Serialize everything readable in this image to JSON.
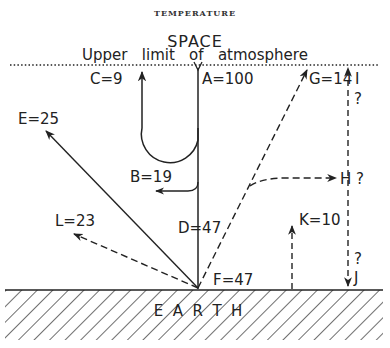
{
  "header": {
    "title": "TEMPERATURE"
  },
  "diagram": {
    "space_label": "SPACE",
    "upper_limit_label": "Upper   limit   of   atmosphere",
    "earth_label": "E  A  R  T  H",
    "labels": {
      "A": "A=100",
      "B": "B=19",
      "C": "C=9",
      "D": "D=47",
      "E": "E=25",
      "F": "F=47",
      "G": "G=14",
      "H": "H ?",
      "I": "I",
      "I_q": "?",
      "J": "J",
      "J_q": "?",
      "K": "K=10",
      "L": "L=23"
    },
    "colors": {
      "ink": "#222222",
      "background": "#ffffff"
    }
  }
}
